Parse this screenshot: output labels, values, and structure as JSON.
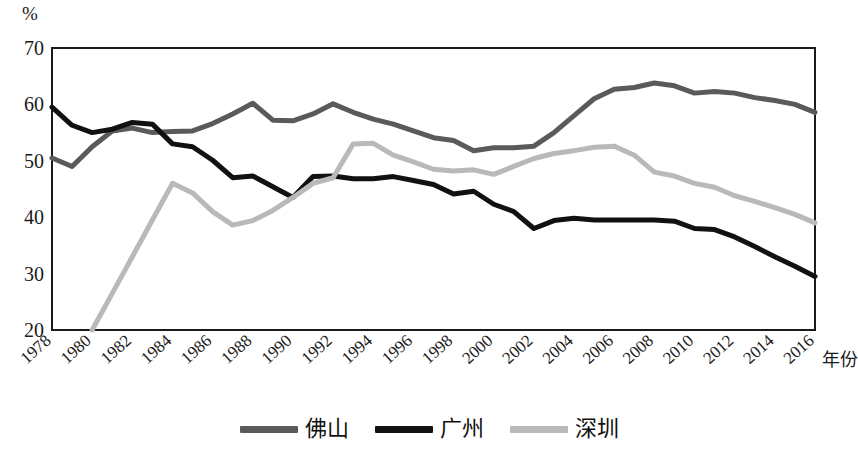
{
  "chart_data": {
    "type": "line",
    "title": "",
    "unit_label": "%",
    "xlabel": "年份",
    "ylabel": "",
    "ylim": [
      20,
      70
    ],
    "yticks": [
      20,
      30,
      40,
      50,
      60,
      70
    ],
    "xlim": [
      1978,
      2016
    ],
    "xticks": [
      1978,
      1980,
      1982,
      1984,
      1986,
      1988,
      1990,
      1992,
      1994,
      1996,
      1998,
      2000,
      2002,
      2004,
      2006,
      2008,
      2010,
      2012,
      2014,
      2016
    ],
    "x": [
      1978,
      1979,
      1980,
      1981,
      1982,
      1983,
      1984,
      1985,
      1986,
      1987,
      1988,
      1989,
      1990,
      1991,
      1992,
      1993,
      1994,
      1995,
      1996,
      1997,
      1998,
      1999,
      2000,
      2001,
      2002,
      2003,
      2004,
      2005,
      2006,
      2007,
      2008,
      2009,
      2010,
      2011,
      2012,
      2013,
      2014,
      2015,
      2016
    ],
    "grid": false,
    "legend_position": "bottom",
    "series": [
      {
        "name": "佛山",
        "color": "#5a5a5a",
        "values": [
          50.5,
          49.0,
          52.5,
          55.3,
          55.8,
          55.0,
          55.2,
          55.3,
          56.6,
          58.3,
          60.2,
          57.2,
          57.1,
          58.3,
          60.1,
          58.6,
          57.4,
          56.5,
          55.3,
          54.1,
          53.6,
          51.8,
          52.3,
          52.3,
          52.6,
          55.0,
          58.0,
          61.0,
          62.7,
          63.0,
          63.8,
          63.3,
          62.0,
          62.3,
          62.0,
          61.2,
          60.7,
          60.0,
          58.6
        ]
      },
      {
        "name": "广州",
        "color": "#111111",
        "values": [
          59.5,
          56.3,
          55.0,
          55.6,
          56.8,
          56.5,
          53.0,
          52.5,
          50.1,
          47.0,
          47.3,
          45.4,
          43.5,
          47.2,
          47.3,
          46.8,
          46.8,
          47.2,
          46.5,
          45.8,
          44.1,
          44.6,
          42.3,
          41.0,
          38.0,
          39.4,
          39.8,
          39.5,
          39.5,
          39.5,
          39.5,
          39.3,
          38.0,
          37.8,
          36.5,
          34.8,
          33.0,
          31.3,
          29.5
        ]
      },
      {
        "name": "深圳",
        "color": "#b9b9b9",
        "values": [
          null,
          null,
          20.0,
          26.5,
          33.0,
          39.5,
          46.0,
          44.3,
          41.0,
          38.6,
          39.4,
          41.2,
          43.5,
          46.0,
          47.0,
          53.0,
          53.1,
          51.0,
          49.8,
          48.5,
          48.2,
          48.4,
          47.6,
          49.0,
          50.4,
          51.3,
          51.8,
          52.4,
          52.6,
          51.0,
          48.0,
          47.3,
          46.0,
          45.3,
          43.8,
          42.8,
          41.7,
          40.5,
          39.0
        ]
      }
    ]
  }
}
